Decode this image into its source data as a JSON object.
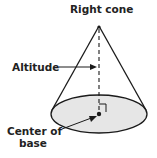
{
  "diagram": {
    "title": "Right cone",
    "labels": {
      "altitude": "Altitude",
      "center_line1": "Center of",
      "center_line2": "base"
    },
    "colors": {
      "stroke": "#1a1a1a",
      "base_fill": "#e6e6e6",
      "text": "#222222",
      "background": "#ffffff"
    }
  }
}
